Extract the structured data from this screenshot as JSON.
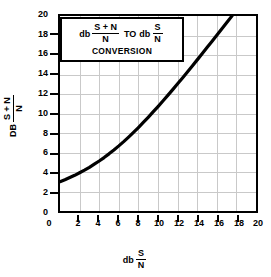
{
  "chart_data": {
    "type": "line",
    "title_parts": {
      "unit_left": "db",
      "num_left": "S + N",
      "den_left": "N",
      "connector": "TO",
      "unit_right": "db",
      "num_right": "S",
      "den_right": "N",
      "second_line": "CONVERSION"
    },
    "xlabel": "db S/N",
    "xlabel_parts": {
      "unit": "db",
      "num": "S",
      "den": "N"
    },
    "ylabel": "DB (S+N)/N",
    "ylabel_parts": {
      "unit": "DB",
      "num": "S + N",
      "den": "N"
    },
    "xlim": [
      0,
      20
    ],
    "ylim": [
      0,
      20
    ],
    "grid": true,
    "grid_color": "#c9c9c9",
    "curve_color": "#000000",
    "legend": null,
    "xticks": [
      0,
      2,
      4,
      6,
      8,
      10,
      12,
      14,
      16,
      18,
      20
    ],
    "xtick_labels": [
      "0",
      "2",
      "4",
      "6",
      "8",
      "10",
      "12",
      "14",
      "16",
      "18",
      "20"
    ],
    "yticks": [
      0,
      2,
      4,
      6,
      8,
      10,
      12,
      14,
      16,
      18,
      20
    ],
    "ytick_labels": [
      "0",
      "2",
      "4",
      "6",
      "8",
      "10",
      "12",
      "14",
      "16",
      "18",
      "20"
    ],
    "x": [
      0,
      0.5,
      1,
      1.5,
      2,
      2.5,
      3,
      3.5,
      4,
      4.5,
      5,
      5.5,
      6,
      6.5,
      7,
      7.5,
      8,
      8.5,
      9,
      9.5,
      10,
      10.5,
      11,
      11.5,
      12,
      12.5,
      13,
      13.5,
      14,
      14.5,
      15,
      15.5,
      16,
      16.5,
      17,
      17.5,
      18,
      18.5,
      19,
      19.5,
      20
    ],
    "values": [
      3.01,
      3.21,
      3.43,
      3.66,
      3.92,
      4.19,
      4.48,
      4.8,
      5.13,
      5.48,
      5.86,
      6.26,
      6.68,
      7.12,
      7.58,
      8.06,
      8.56,
      9.08,
      9.61,
      10.16,
      10.71,
      11.28,
      11.86,
      12.45,
      13.05,
      13.65,
      14.26,
      14.88,
      15.5,
      16.13,
      16.76,
      17.39,
      18.02,
      18.66,
      19.3,
      19.94,
      20.58,
      21.22,
      21.86,
      22.5,
      23.14
    ],
    "series": [
      {
        "name": "db (S+N)/N vs db S/N",
        "values": [
          3.01,
          3.21,
          3.43,
          3.66,
          3.92,
          4.19,
          4.48,
          4.8,
          5.13,
          5.48,
          5.86,
          6.26,
          6.68,
          7.12,
          7.58,
          8.06,
          8.56,
          9.08,
          9.61,
          10.16,
          10.71,
          11.28,
          11.86,
          12.45,
          13.05,
          13.65,
          14.26,
          14.88,
          15.5,
          16.13,
          16.76,
          17.39,
          18.02,
          18.66,
          19.3,
          19.94,
          20.58,
          21.22,
          21.86,
          22.5,
          23.14
        ]
      }
    ]
  }
}
